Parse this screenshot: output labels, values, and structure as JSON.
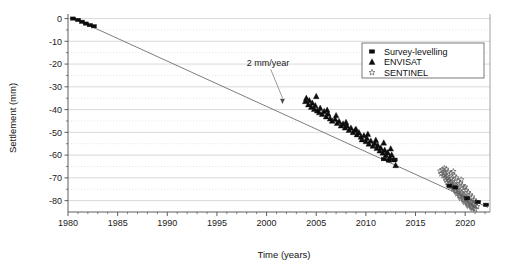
{
  "chart_data": {
    "type": "scatter",
    "title": "",
    "xlabel": "Time (years)",
    "ylabel": "Settlement (mm)",
    "xlim": [
      1980,
      2022.5
    ],
    "ylim": [
      -85,
      2
    ],
    "grid": true,
    "x_major_ticks": [
      1980,
      1985,
      1990,
      1995,
      2000,
      2005,
      2010,
      2015,
      2020
    ],
    "x_tick_labels": [
      "1980",
      "1985",
      "1990",
      "1995",
      "2000",
      "2005",
      "2010",
      "2015",
      "2020"
    ],
    "x_minor_step": 1,
    "y_major_ticks": [
      0,
      -10,
      -20,
      -30,
      -40,
      -50,
      -60,
      -70,
      -80
    ],
    "y_tick_labels": [
      "0",
      "-10",
      "-20",
      "-30",
      "-40",
      "-50",
      "-60",
      "-70",
      "-80"
    ],
    "y_minor_step": 5,
    "legend_position": "top-right",
    "annotations": [
      {
        "text": "2 mm/year",
        "x": 1998.0,
        "y": -21.0,
        "arrow_to_x": 2001.6,
        "arrow_to_y": -37.5
      }
    ],
    "trendline": {
      "name": "2 mm/year settlement rate",
      "x": [
        1980.6,
        2022.3
      ],
      "y": [
        0.0,
        -83.0
      ],
      "slope_mm_per_year": -2.0
    },
    "series": [
      {
        "name": "Survey-levelling",
        "marker": "filled-square",
        "color": "#0d0d0d",
        "points": [
          [
            1980.5,
            0.0
          ],
          [
            1981.0,
            -0.6
          ],
          [
            1981.4,
            -1.4
          ],
          [
            1981.8,
            -2.2
          ],
          [
            1982.2,
            -2.9
          ],
          [
            1982.6,
            -3.4
          ],
          [
            2011.8,
            -61.8
          ],
          [
            2012.3,
            -62.4
          ],
          [
            2012.9,
            -62.0
          ],
          [
            2018.4,
            -73.5
          ],
          [
            2019.0,
            -74.2
          ],
          [
            2020.2,
            -79.0
          ],
          [
            2021.3,
            -80.6
          ],
          [
            2022.1,
            -81.8
          ]
        ]
      },
      {
        "name": "ENVISAT",
        "marker": "filled-triangle",
        "color": "#0d0d0d",
        "points": [
          [
            2003.9,
            -36.4
          ],
          [
            2004.0,
            -35.0
          ],
          [
            2004.2,
            -37.8
          ],
          [
            2004.3,
            -36.0
          ],
          [
            2004.5,
            -38.9
          ],
          [
            2004.6,
            -37.1
          ],
          [
            2004.8,
            -39.8
          ],
          [
            2004.9,
            -38.2
          ],
          [
            2005.0,
            -34.2
          ],
          [
            2005.1,
            -40.5
          ],
          [
            2005.3,
            -41.3
          ],
          [
            2005.4,
            -39.4
          ],
          [
            2005.6,
            -42.0
          ],
          [
            2005.8,
            -40.8
          ],
          [
            2006.0,
            -43.1
          ],
          [
            2006.2,
            -41.9
          ],
          [
            2006.4,
            -44.0
          ],
          [
            2006.6,
            -45.0
          ],
          [
            2006.9,
            -44.2
          ],
          [
            2007.1,
            -46.0
          ],
          [
            2007.3,
            -45.2
          ],
          [
            2007.5,
            -47.1
          ],
          [
            2007.7,
            -46.3
          ],
          [
            2007.9,
            -48.0
          ],
          [
            2008.1,
            -47.2
          ],
          [
            2008.3,
            -49.0
          ],
          [
            2008.5,
            -48.1
          ],
          [
            2008.7,
            -50.0
          ],
          [
            2008.9,
            -49.2
          ],
          [
            2009.1,
            -51.0
          ],
          [
            2009.3,
            -50.1
          ],
          [
            2009.5,
            -52.0
          ],
          [
            2009.6,
            -53.2
          ],
          [
            2009.8,
            -51.4
          ],
          [
            2010.0,
            -54.0
          ],
          [
            2010.1,
            -52.6
          ],
          [
            2010.3,
            -55.1
          ],
          [
            2010.5,
            -53.8
          ],
          [
            2010.7,
            -56.0
          ],
          [
            2010.9,
            -54.9
          ],
          [
            2011.1,
            -57.0
          ],
          [
            2011.2,
            -55.8
          ],
          [
            2011.4,
            -58.1
          ],
          [
            2011.5,
            -56.9
          ],
          [
            2011.7,
            -59.0
          ],
          [
            2011.9,
            -57.8
          ],
          [
            2012.0,
            -60.0
          ],
          [
            2012.2,
            -58.9
          ],
          [
            2012.4,
            -61.0
          ],
          [
            2012.6,
            -59.9
          ],
          [
            2012.8,
            -62.0
          ],
          [
            2013.0,
            -64.5
          ],
          [
            2006.1,
            -40.2
          ],
          [
            2007.0,
            -42.6
          ],
          [
            2008.0,
            -45.6
          ],
          [
            2009.0,
            -48.6
          ],
          [
            2010.2,
            -50.8
          ],
          [
            2011.0,
            -53.4
          ],
          [
            2011.8,
            -54.6
          ],
          [
            2012.5,
            -57.2
          ]
        ]
      },
      {
        "name": "SENTINEL",
        "marker": "open-star",
        "color": "#5e5e5e",
        "points": [
          [
            2017.5,
            -67.0
          ],
          [
            2017.6,
            -68.2
          ],
          [
            2017.7,
            -66.5
          ],
          [
            2017.8,
            -69.0
          ],
          [
            2017.9,
            -67.8
          ],
          [
            2018.0,
            -70.1
          ],
          [
            2018.0,
            -68.6
          ],
          [
            2018.1,
            -71.0
          ],
          [
            2018.2,
            -69.4
          ],
          [
            2018.2,
            -72.0
          ],
          [
            2018.3,
            -70.2
          ],
          [
            2018.4,
            -73.0
          ],
          [
            2018.4,
            -71.1
          ],
          [
            2018.5,
            -74.0
          ],
          [
            2018.5,
            -72.0
          ],
          [
            2018.6,
            -70.5
          ],
          [
            2018.7,
            -73.5
          ],
          [
            2018.7,
            -71.6
          ],
          [
            2018.8,
            -74.8
          ],
          [
            2018.9,
            -72.6
          ],
          [
            2019.0,
            -75.5
          ],
          [
            2019.0,
            -73.2
          ],
          [
            2019.1,
            -76.2
          ],
          [
            2019.2,
            -74.1
          ],
          [
            2019.2,
            -77.0
          ],
          [
            2019.3,
            -75.0
          ],
          [
            2019.4,
            -77.8
          ],
          [
            2019.4,
            -75.8
          ],
          [
            2019.5,
            -78.4
          ],
          [
            2019.6,
            -76.4
          ],
          [
            2019.6,
            -79.0
          ],
          [
            2019.7,
            -77.0
          ],
          [
            2019.8,
            -79.6
          ],
          [
            2019.8,
            -77.6
          ],
          [
            2019.9,
            -80.2
          ],
          [
            2020.0,
            -78.2
          ],
          [
            2020.0,
            -80.8
          ],
          [
            2020.1,
            -78.8
          ],
          [
            2020.2,
            -81.4
          ],
          [
            2020.2,
            -79.4
          ],
          [
            2020.3,
            -82.0
          ],
          [
            2020.4,
            -80.0
          ],
          [
            2020.4,
            -82.4
          ],
          [
            2020.5,
            -80.6
          ],
          [
            2020.6,
            -82.8
          ],
          [
            2020.6,
            -81.0
          ],
          [
            2020.7,
            -83.2
          ],
          [
            2020.8,
            -81.4
          ],
          [
            2020.8,
            -83.5
          ],
          [
            2020.9,
            -81.8
          ],
          [
            2021.0,
            -83.8
          ],
          [
            2021.0,
            -82.2
          ],
          [
            2018.3,
            -67.5
          ],
          [
            2018.6,
            -68.0
          ],
          [
            2018.9,
            -69.2
          ],
          [
            2019.1,
            -70.0
          ],
          [
            2019.3,
            -71.5
          ],
          [
            2019.5,
            -72.4
          ],
          [
            2019.7,
            -73.4
          ],
          [
            2019.9,
            -74.4
          ],
          [
            2020.1,
            -75.4
          ],
          [
            2020.3,
            -76.4
          ],
          [
            2020.5,
            -77.4
          ],
          [
            2020.7,
            -78.4
          ],
          [
            2017.9,
            -65.8
          ],
          [
            2018.1,
            -66.2
          ],
          [
            2018.8,
            -67.2
          ],
          [
            2019.6,
            -70.8
          ],
          [
            2020.0,
            -74.0
          ],
          [
            2020.9,
            -79.8
          ],
          [
            2021.1,
            -80.4
          ],
          [
            2021.2,
            -82.6
          ]
        ]
      }
    ]
  },
  "legend": {
    "items": [
      {
        "label": "Survey-levelling",
        "marker": "filled-square"
      },
      {
        "label": "ENVISAT",
        "marker": "filled-triangle"
      },
      {
        "label": "SENTINEL",
        "marker": "open-star"
      }
    ]
  }
}
